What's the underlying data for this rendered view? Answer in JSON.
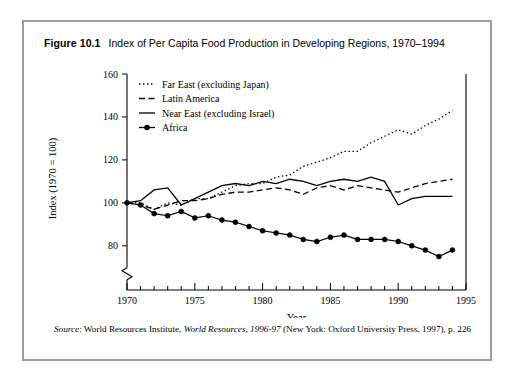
{
  "figure": {
    "label": "Figure 10.1",
    "caption": "Index of Per Capita Food Production in Developing Regions, 1970–1994",
    "source_prefix": "Source",
    "source_text": ": World Resources Institute, World Resources, 1996-97 (New York: Oxford University Press, 1997), p. 226"
  },
  "chart_data": {
    "type": "line",
    "title": "Index of Per Capita Food Production in Developing Regions, 1970–1994",
    "xlabel": "Year",
    "ylabel": "Index (1970 = 100)",
    "xlim": [
      1970,
      1995
    ],
    "ylim": [
      72,
      160
    ],
    "y_ticks": [
      80,
      100,
      120,
      140,
      160
    ],
    "x_ticks": [
      1970,
      1975,
      1980,
      1985,
      1990,
      1995
    ],
    "x_minor_step": 1,
    "axis_break": true,
    "grid": false,
    "legend_position": "top-left",
    "x": [
      1970,
      1971,
      1972,
      1973,
      1974,
      1975,
      1976,
      1977,
      1978,
      1979,
      1980,
      1981,
      1982,
      1983,
      1984,
      1985,
      1986,
      1987,
      1988,
      1989,
      1990,
      1991,
      1992,
      1993,
      1994
    ],
    "series": [
      {
        "name": "Far East (excluding Japan)",
        "style": "dotted",
        "marker": "none",
        "color": "#000000",
        "values": [
          100,
          100,
          97,
          100,
          99,
          102,
          102,
          105,
          108,
          109,
          109,
          112,
          113,
          117,
          119,
          121,
          124,
          124,
          128,
          131,
          134,
          132,
          136,
          139,
          143
        ]
      },
      {
        "name": "Latin America",
        "style": "dashed",
        "marker": "none",
        "color": "#000000",
        "values": [
          100,
          99,
          97,
          99,
          101,
          101,
          102,
          104,
          105,
          105,
          106,
          107,
          106,
          104,
          107,
          108,
          106,
          108,
          107,
          106,
          105,
          107,
          109,
          110,
          111
        ]
      },
      {
        "name": "Near East (excluding Israel)",
        "style": "solid",
        "marker": "none",
        "color": "#000000",
        "values": [
          100,
          101,
          106,
          107,
          99,
          102,
          105,
          108,
          109,
          108,
          110,
          109,
          111,
          110,
          108,
          110,
          111,
          110,
          112,
          110,
          99,
          102,
          103,
          103,
          103
        ]
      },
      {
        "name": "Africa",
        "style": "solid",
        "marker": "circle",
        "color": "#000000",
        "values": [
          100,
          99,
          95,
          94,
          96,
          93,
          94,
          92,
          91,
          89,
          87,
          86,
          85,
          83,
          82,
          84,
          85,
          83,
          83,
          83,
          82,
          80,
          78,
          75,
          78
        ]
      }
    ]
  }
}
